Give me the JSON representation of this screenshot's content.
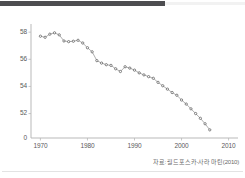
{
  "banner": {
    "name": "header-band",
    "color": "#4d4d50"
  },
  "source": {
    "text": "자료: 월드포스카-사라 마틴(2010)"
  },
  "chart_data": {
    "type": "line",
    "title": "",
    "subtitle": "",
    "xlabel": "",
    "ylabel": "",
    "grid": false,
    "legend": "none",
    "marker": "dot",
    "line_color": "#9a9a9a",
    "marker_color": "#555555",
    "axis_color": "#b5b5b5",
    "xlim": [
      1968,
      2012
    ],
    "ylim": [
      50.2,
      58.6
    ],
    "y_axis_broken": true,
    "xticks": [
      1970,
      1980,
      1990,
      2000,
      2010
    ],
    "xtick_labels": [
      "1970",
      "1980",
      "1990",
      "2000",
      "2010"
    ],
    "yticks": [
      0,
      52,
      54,
      56,
      58
    ],
    "ytick_labels": [
      "0",
      "52",
      "54",
      "56",
      "58"
    ],
    "x": [
      1970,
      1971,
      1972,
      1973,
      1974,
      1975,
      1976,
      1977,
      1978,
      1979,
      1980,
      1981,
      1982,
      1983,
      1984,
      1985,
      1986,
      1987,
      1988,
      1989,
      1990,
      1991,
      1992,
      1993,
      1994,
      1995,
      1996,
      1997,
      1998,
      1999,
      2000,
      2001,
      2002,
      2003,
      2004,
      2005,
      2006
    ],
    "values": [
      57.7,
      57.62,
      57.85,
      57.95,
      57.8,
      57.35,
      57.3,
      57.33,
      57.4,
      57.2,
      56.85,
      56.55,
      55.9,
      55.72,
      55.6,
      55.55,
      55.3,
      55.1,
      55.45,
      55.35,
      55.2,
      55.0,
      54.85,
      54.72,
      54.6,
      54.3,
      54.05,
      53.8,
      53.55,
      53.35,
      53.0,
      52.7,
      52.35,
      52.0,
      51.65,
      51.25,
      50.8
    ]
  }
}
